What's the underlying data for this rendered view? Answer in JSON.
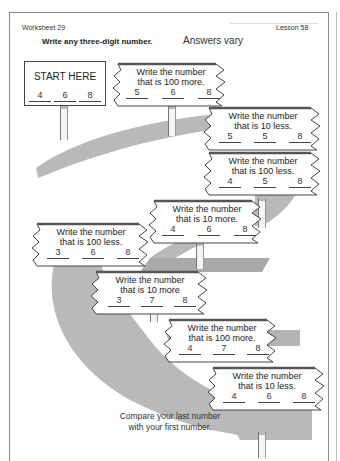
{
  "header": {
    "worksheet": "Worksheet 29",
    "lesson": "Lesson 58"
  },
  "instruction": {
    "prompt": "Write any three-digit number.",
    "note": "Answers vary"
  },
  "start_sign": {
    "title": "START HERE",
    "digits": [
      "4",
      "6",
      "8"
    ]
  },
  "signs": [
    {
      "line1": "Write the number",
      "line2": "that is 100 more.",
      "digits": [
        "5",
        "6",
        "8"
      ]
    },
    {
      "line1": "Write the number",
      "line2": "that is 10 less.",
      "digits": [
        "5",
        "5",
        "8"
      ]
    },
    {
      "line1": "Write the number",
      "line2": "that is 100 less.",
      "digits": [
        "4",
        "5",
        "8"
      ]
    },
    {
      "line1": "Write the number",
      "line2": "that is 10 more.",
      "digits": [
        "4",
        "6",
        "8"
      ]
    },
    {
      "line1": "Write the number",
      "line2": "that is 100 less.",
      "digits": [
        "3",
        "6",
        "8"
      ]
    },
    {
      "line1": "Write the number",
      "line2": "that is 10 more",
      "digits": [
        "3",
        "7",
        "8"
      ]
    },
    {
      "line1": "Write the number",
      "line2": "that is 100 more.",
      "digits": [
        "4",
        "7",
        "8"
      ]
    },
    {
      "line1": "Write the number",
      "line2": "that is 10 less.",
      "digits": [
        "4",
        "6",
        "8"
      ]
    }
  ],
  "closing": {
    "line1": "Compare your last number",
    "line2": "with your first number."
  },
  "colors": {
    "road": "#b9b9b9",
    "road_dark": "#a3a3a3",
    "sign_border": "#444444"
  }
}
